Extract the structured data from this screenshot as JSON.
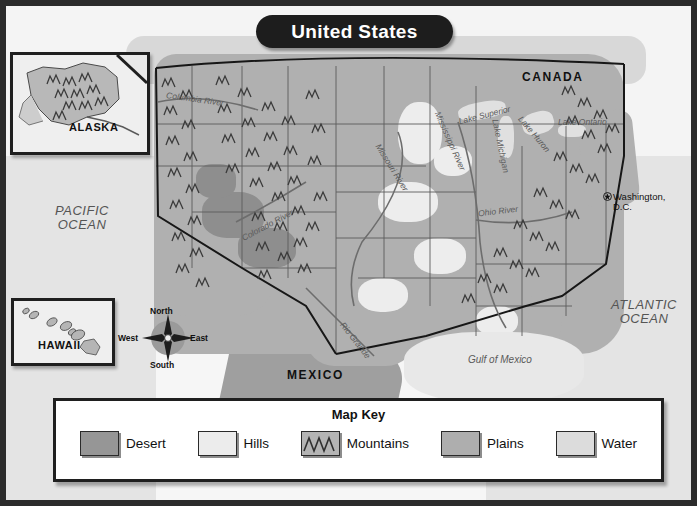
{
  "title": {
    "text": "United States"
  },
  "insets": [
    {
      "id": "alaska",
      "label": "ALASKA"
    },
    {
      "id": "hawaii",
      "label": "HAWAII"
    }
  ],
  "compass": {
    "north": "North",
    "south": "South",
    "east": "East",
    "west": "West"
  },
  "countries": [
    {
      "name": "CANADA"
    },
    {
      "name": "MEXICO"
    }
  ],
  "oceans": [
    {
      "line1": "PACIFIC",
      "line2": "OCEAN"
    },
    {
      "line1": "ATLANTIC",
      "line2": "OCEAN"
    }
  ],
  "water_features": [
    {
      "name": "Columbia River"
    },
    {
      "name": "Missouri River"
    },
    {
      "name": "Mississippi River"
    },
    {
      "name": "Ohio River"
    },
    {
      "name": "Colorado River"
    },
    {
      "name": "Rio Grande"
    },
    {
      "name": "Lake Superior"
    },
    {
      "name": "Lake Michigan"
    },
    {
      "name": "Lake Huron"
    },
    {
      "name": "Lake Ontario"
    },
    {
      "name": "Gulf of Mexico"
    }
  ],
  "city": {
    "line1": "Washington,",
    "line2": "D.C."
  },
  "map_key": {
    "title": "Map Key",
    "items": [
      {
        "label": "Desert",
        "color": "#969696",
        "pattern": "solid"
      },
      {
        "label": "Hills",
        "color": "#ececec",
        "pattern": "solid"
      },
      {
        "label": "Mountains",
        "color": "#b4b4b4",
        "pattern": "peaks"
      },
      {
        "label": "Plains",
        "color": "#aeaeae",
        "pattern": "solid"
      },
      {
        "label": "Water",
        "color": "#dcdcdc",
        "pattern": "solid"
      }
    ]
  },
  "colors": {
    "frame": "#2b2b2b",
    "title_bg": "#1d1d1d",
    "title_fg": "#ffffff",
    "ocean": "#e4e4e4",
    "land_plains": "#b0b0b0",
    "desert": "#8e8e8e",
    "hills": "#ededed"
  }
}
